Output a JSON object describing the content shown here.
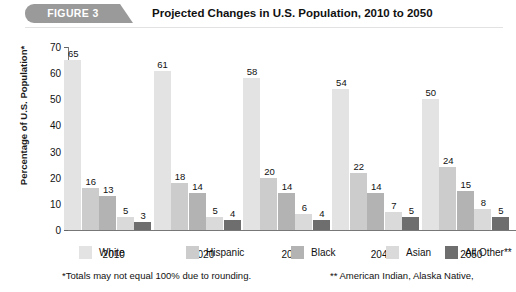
{
  "header": {
    "badge_label": "FIGURE 3",
    "title": "Projected Changes in U.S. Population, 2010 to 2050",
    "badge_color": "#9a9a9a"
  },
  "footnotes": {
    "left": "*Totals may not equal 100% due to rounding.",
    "right": "** American Indian, Alaska Native,"
  },
  "chart_data": {
    "type": "bar",
    "title": "Projected Changes in U.S. Population, 2010 to 2050",
    "xlabel": "",
    "ylabel": "Percentage of U.S. Population*",
    "ylim": [
      0,
      70
    ],
    "yticks": [
      0,
      10,
      20,
      30,
      40,
      50,
      60,
      70
    ],
    "grid": false,
    "legend_position": "bottom",
    "categories": [
      "2010",
      "2020",
      "2030",
      "2040",
      "2050"
    ],
    "series": [
      {
        "name": "White",
        "color": "#e3e3e3",
        "values": [
          65,
          61,
          58,
          54,
          50
        ]
      },
      {
        "name": "Hispanic",
        "color": "#cccccc",
        "values": [
          16,
          18,
          20,
          22,
          24
        ]
      },
      {
        "name": "Black",
        "color": "#b3b3b3",
        "values": [
          13,
          14,
          14,
          14,
          15
        ]
      },
      {
        "name": "Asian",
        "color": "#dadada",
        "values": [
          5,
          5,
          6,
          7,
          8
        ]
      },
      {
        "name": "All Other**",
        "color": "#6e6e6e",
        "values": [
          3,
          4,
          4,
          5,
          5
        ]
      }
    ]
  }
}
